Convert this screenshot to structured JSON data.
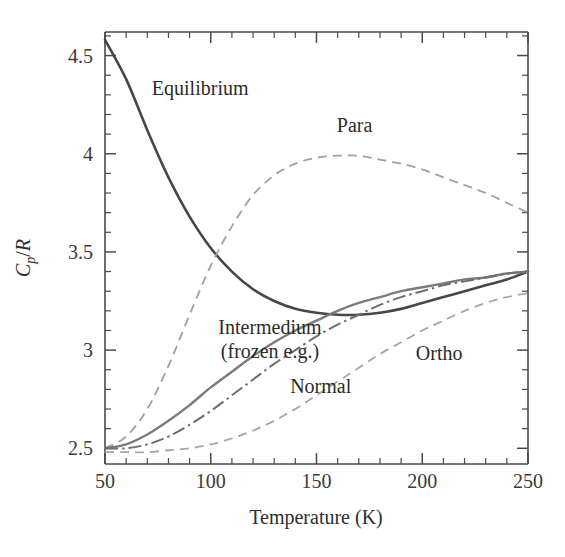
{
  "chart_data": {
    "type": "line",
    "title": "",
    "xlabel": "Temperature (K)",
    "ylabel": "C_p/R",
    "ylabel_parts": {
      "main": "C",
      "sub": "p",
      "slash": "/",
      "denom": "R"
    },
    "xlim": [
      50,
      250
    ],
    "ylim": [
      2.42,
      4.62
    ],
    "grid": false,
    "legend_position": "inline-annotations",
    "x_ticks_major": [
      50,
      100,
      150,
      200,
      250
    ],
    "x_tick_labels": [
      "50",
      "100",
      "150",
      "200",
      "250"
    ],
    "x_tick_minor_step": 10,
    "y_ticks_major": [
      2.5,
      3,
      3.5,
      4,
      4.5
    ],
    "y_tick_labels": [
      "2.5",
      "3",
      "3.5",
      "4",
      "4.5"
    ],
    "y_tick_minor_step": 0.1,
    "x": [
      50,
      60,
      70,
      80,
      90,
      100,
      110,
      120,
      130,
      140,
      150,
      160,
      170,
      180,
      190,
      200,
      210,
      220,
      230,
      240,
      250
    ],
    "series": [
      {
        "name": "Equilibrium",
        "label": "Equilibrium",
        "style": "solid",
        "color": "#474747",
        "label_x": 95,
        "label_y": 4.3,
        "values": [
          4.58,
          4.38,
          4.12,
          3.88,
          3.68,
          3.52,
          3.4,
          3.31,
          3.25,
          3.21,
          3.19,
          3.18,
          3.18,
          3.19,
          3.21,
          3.24,
          3.27,
          3.3,
          3.33,
          3.36,
          3.4
        ]
      },
      {
        "name": "Para",
        "label": "Para",
        "style": "dashed",
        "color": "#a0a0a0",
        "label_x": 168,
        "label_y": 4.11,
        "values": [
          2.5,
          2.56,
          2.7,
          2.92,
          3.18,
          3.43,
          3.63,
          3.79,
          3.89,
          3.95,
          3.98,
          3.99,
          3.99,
          3.97,
          3.95,
          3.92,
          3.88,
          3.84,
          3.8,
          3.75,
          3.7
        ]
      },
      {
        "name": "Ortho",
        "label": "Ortho",
        "style": "dashed",
        "color": "#a6a6a6",
        "label_x": 208,
        "label_y": 2.95,
        "values": [
          2.48,
          2.48,
          2.48,
          2.49,
          2.5,
          2.52,
          2.55,
          2.59,
          2.64,
          2.7,
          2.77,
          2.84,
          2.91,
          2.98,
          3.04,
          3.1,
          3.15,
          3.2,
          3.24,
          3.27,
          3.29
        ]
      },
      {
        "name": "Intermedium (frozen e.g.)",
        "label_line1": "Intermedium",
        "label_line2": "(frozen e.g.)",
        "style": "solid",
        "color": "#7b7b7b",
        "label_x": 128,
        "label_y": 3.08,
        "values": [
          2.5,
          2.52,
          2.57,
          2.64,
          2.72,
          2.81,
          2.89,
          2.97,
          3.04,
          3.1,
          3.15,
          3.2,
          3.24,
          3.27,
          3.3,
          3.32,
          3.34,
          3.36,
          3.37,
          3.39,
          3.4
        ]
      },
      {
        "name": "Normal",
        "label": "Normal",
        "style": "dash-dot",
        "color": "#6e6e6e",
        "label_x": 152,
        "label_y": 2.78,
        "values": [
          2.5,
          2.5,
          2.52,
          2.56,
          2.62,
          2.69,
          2.77,
          2.85,
          2.93,
          3.0,
          3.07,
          3.13,
          3.18,
          3.23,
          3.27,
          3.3,
          3.33,
          3.35,
          3.37,
          3.39,
          3.4
        ]
      }
    ]
  }
}
